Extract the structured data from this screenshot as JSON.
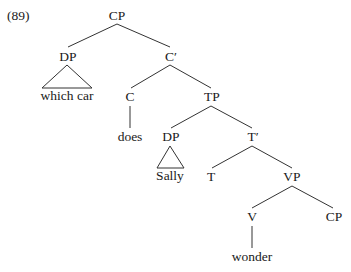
{
  "example_number": "(89)",
  "tree": {
    "root": "CP",
    "nodes": {
      "cp_root": "CP",
      "dp_spec": "DP",
      "dp_spec_text": "which car",
      "c_bar": "C′",
      "c_head": "C",
      "c_head_text": "does",
      "tp": "TP",
      "dp_subj": "DP",
      "dp_subj_text": "Sally",
      "t_bar": "T′",
      "t_head": "T",
      "vp": "VP",
      "v_head": "V",
      "v_head_text": "wonder",
      "cp_comp": "CP"
    },
    "edges": [
      [
        "CP",
        "DP"
      ],
      [
        "CP",
        "C′"
      ],
      [
        "DP",
        "which car (triangle)"
      ],
      [
        "C′",
        "C"
      ],
      [
        "C′",
        "TP"
      ],
      [
        "C",
        "does"
      ],
      [
        "TP",
        "DP"
      ],
      [
        "TP",
        "T′"
      ],
      [
        "DP",
        "Sally (triangle)"
      ],
      [
        "T′",
        "T"
      ],
      [
        "T′",
        "VP"
      ],
      [
        "VP",
        "V"
      ],
      [
        "VP",
        "CP"
      ],
      [
        "V",
        "wonder"
      ]
    ]
  }
}
